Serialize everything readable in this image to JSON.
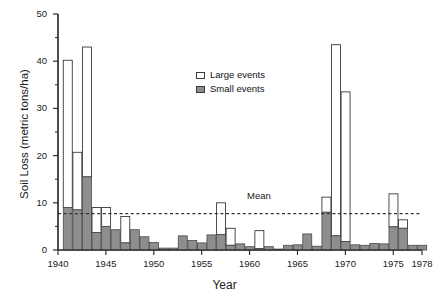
{
  "chart_data": {
    "type": "bar",
    "title": "",
    "xlabel": "Year",
    "ylabel": "Soil Loss (metric tons/ha)",
    "xlim": [
      1940,
      1978
    ],
    "ylim": [
      0,
      50
    ],
    "yticks": [
      0,
      10,
      20,
      30,
      40,
      50
    ],
    "yticks_minor": [
      5,
      15,
      25,
      35,
      45
    ],
    "xticks": [
      1940,
      1945,
      1950,
      1955,
      1960,
      1965,
      1970,
      1975,
      1978
    ],
    "grid": false,
    "stacked": true,
    "legend_position": "upper-center",
    "legend": [
      "Large events",
      "Small events"
    ],
    "annotations": [
      {
        "label": "Mean",
        "type": "hline",
        "value": 7.7,
        "style": "dashed"
      }
    ],
    "categories": [
      1941,
      1942,
      1943,
      1944,
      1945,
      1946,
      1947,
      1948,
      1949,
      1950,
      1951,
      1952,
      1953,
      1954,
      1955,
      1956,
      1957,
      1958,
      1959,
      1960,
      1961,
      1962,
      1963,
      1964,
      1965,
      1966,
      1967,
      1968,
      1969,
      1970,
      1971,
      1972,
      1973,
      1974,
      1975,
      1976,
      1977,
      1978
    ],
    "series": [
      {
        "name": "Small events",
        "color": "#8e8e8e",
        "values": [
          9.0,
          8.5,
          15.5,
          3.7,
          5.0,
          4.3,
          1.5,
          4.3,
          2.8,
          1.6,
          0.4,
          0.4,
          3.0,
          2.0,
          1.5,
          3.2,
          3.3,
          1.0,
          1.3,
          0.7,
          0.3,
          0.7,
          0.2,
          1.0,
          1.1,
          3.4,
          0.8,
          8.0,
          3.0,
          1.8,
          1.1,
          1.0,
          1.4,
          1.3,
          4.9,
          4.6,
          1.0,
          1.0
        ]
      },
      {
        "name": "Large events",
        "color": "#ffffff",
        "values": [
          31.2,
          12.2,
          27.5,
          5.3,
          4.0,
          0.0,
          5.6,
          0.0,
          0.0,
          0.0,
          0.0,
          0.0,
          0.0,
          0.0,
          0.0,
          0.0,
          6.7,
          3.6,
          0.0,
          0.0,
          3.8,
          0.0,
          0.0,
          0.0,
          0.0,
          0.0,
          0.0,
          3.2,
          40.5,
          31.7,
          0.0,
          0.0,
          0.0,
          0.0,
          7.0,
          1.8,
          0.0,
          0.0
        ]
      }
    ],
    "totals": [
      40.2,
      20.7,
      43.0,
      9.0,
      9.0,
      4.3,
      7.1,
      4.3,
      2.8,
      1.6,
      0.4,
      0.4,
      3.0,
      2.0,
      1.5,
      3.2,
      10.0,
      4.6,
      1.3,
      0.7,
      4.1,
      0.7,
      0.2,
      1.0,
      1.1,
      3.4,
      0.8,
      11.2,
      43.5,
      33.5,
      1.1,
      1.0,
      1.4,
      1.3,
      11.9,
      6.4,
      1.0,
      1.0
    ]
  },
  "axes": {
    "ylabel": "Soil Loss (metric tons/ha)",
    "xlabel": "Year",
    "ytick_labels": [
      "0",
      "10",
      "20",
      "30",
      "40",
      "50"
    ],
    "xtick_labels": [
      "1940",
      "1945",
      "1950",
      "1955",
      "1960",
      "1965",
      "1970",
      "1975",
      "1978"
    ]
  },
  "legend": {
    "items": [
      {
        "label": "Large events",
        "swatch": "white"
      },
      {
        "label": "Small events",
        "swatch": "gray"
      }
    ]
  },
  "mean": {
    "label": "Mean",
    "value": 7.7
  },
  "colors": {
    "small_events": "#8e8e8e",
    "large_events": "#ffffff",
    "axis": "#222222",
    "mean_line": "#333333",
    "background": "#ffffff"
  }
}
